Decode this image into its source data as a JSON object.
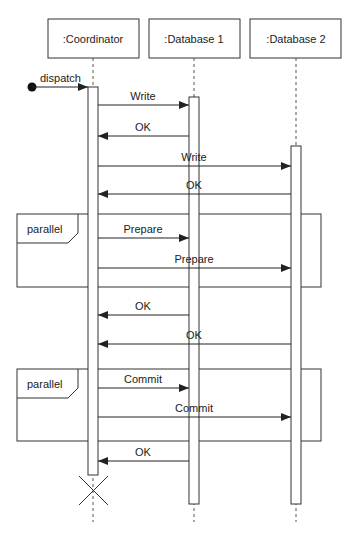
{
  "lifelines": [
    {
      "label": ":Coordinator",
      "x": 93
    },
    {
      "label": ":Database 1",
      "x": 194
    },
    {
      "label": ":Database 2",
      "x": 296
    }
  ],
  "found_message": {
    "label": "dispatch"
  },
  "messages": [
    {
      "label": "Write",
      "from": 0,
      "to": 1,
      "y": 105,
      "type": "call"
    },
    {
      "label": "OK",
      "from": 1,
      "to": 0,
      "y": 136,
      "type": "reply"
    },
    {
      "label": "Write",
      "from": 0,
      "to": 2,
      "y": 166,
      "type": "call"
    },
    {
      "label": "OK",
      "from": 2,
      "to": 0,
      "y": 194,
      "type": "reply"
    },
    {
      "label": "Prepare",
      "from": 0,
      "to": 1,
      "y": 238,
      "type": "call"
    },
    {
      "label": "Prepare",
      "from": 0,
      "to": 2,
      "y": 268,
      "type": "call"
    },
    {
      "label": "OK",
      "from": 1,
      "to": 0,
      "y": 315,
      "type": "reply"
    },
    {
      "label": "OK",
      "from": 2,
      "to": 0,
      "y": 344,
      "type": "reply"
    },
    {
      "label": "Commit",
      "from": 0,
      "to": 1,
      "y": 388,
      "type": "call"
    },
    {
      "label": "Commit",
      "from": 0,
      "to": 2,
      "y": 417,
      "type": "call"
    },
    {
      "label": "OK",
      "from": 1,
      "to": 0,
      "y": 461,
      "type": "reply"
    }
  ],
  "fragments": [
    {
      "label": "parallel",
      "y1": 214,
      "y2": 287
    },
    {
      "label": "parallel",
      "y1": 369,
      "y2": 441
    }
  ]
}
